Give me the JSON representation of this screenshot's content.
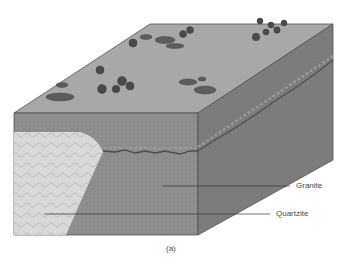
{
  "diagram": {
    "type": "geologic-block-diagram",
    "caption": "(a)",
    "labels": {
      "granite": "Granite",
      "quartzite": "Quartzite"
    },
    "colors": {
      "top_surface": "#a6a6a6",
      "front_face": "#8c8c8c",
      "side_face": "#7a7a7a",
      "quartzite": "#d9d9d9",
      "outline": "#505050",
      "vegetation": "#555555",
      "label_text": "#4a4a4a"
    },
    "features": [
      "trees",
      "shrubs",
      "contact-line",
      "quartzite-body",
      "granite-body"
    ]
  }
}
